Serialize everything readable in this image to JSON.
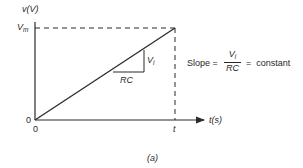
{
  "figure": {
    "caption": "(a)",
    "y_axis_label": "v(V)",
    "y_axis_label_parts": {
      "var": "v",
      "unit": "(V)"
    },
    "x_axis_label": "t(s)",
    "x_axis_label_parts": {
      "var": "t",
      "unit": "(s)"
    },
    "y_max_label": {
      "main": "V",
      "sub": "m"
    },
    "origin_y_label": "0",
    "origin_x_label": "0",
    "x_tick_label": "t",
    "triangle": {
      "run_label": "RC",
      "rise_label": {
        "main": "V",
        "sub": "i"
      }
    },
    "equation": {
      "lhs": "Slope =",
      "numerator": {
        "main": "V",
        "sub": "i"
      },
      "denominator": "RC",
      "rhs": "=  constant"
    },
    "colors": {
      "line": "#2a2a2a",
      "background": "#ffffff"
    }
  }
}
